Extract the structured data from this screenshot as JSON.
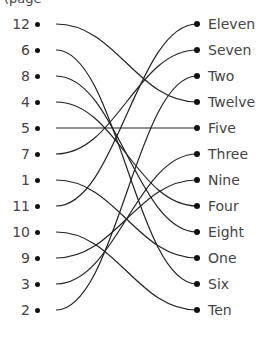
{
  "header_fragment": "(page",
  "left_items": [
    "12",
    "6",
    "8",
    "4",
    "5",
    "7",
    "1",
    "11",
    "10",
    "9",
    "3",
    "2"
  ],
  "right_items": [
    "Eleven",
    "Seven",
    "Two",
    "Twelve",
    "Five",
    "Three",
    "Nine",
    "Four",
    "Eight",
    "One",
    "Six",
    "Ten"
  ],
  "connections": [
    {
      "from": "12",
      "to": "Twelve"
    },
    {
      "from": "6",
      "to": "Six"
    },
    {
      "from": "8",
      "to": "Eight"
    },
    {
      "from": "4",
      "to": "Four"
    },
    {
      "from": "5",
      "to": "Five"
    },
    {
      "from": "7",
      "to": "Seven"
    },
    {
      "from": "1",
      "to": "One"
    },
    {
      "from": "11",
      "to": "Eleven"
    },
    {
      "from": "10",
      "to": "Ten"
    },
    {
      "from": "9",
      "to": "Nine"
    },
    {
      "from": "3",
      "to": "Three"
    },
    {
      "from": "2",
      "to": "Two"
    }
  ],
  "colors": {
    "line": "#222222",
    "dot": "#111111",
    "text": "#444444"
  }
}
